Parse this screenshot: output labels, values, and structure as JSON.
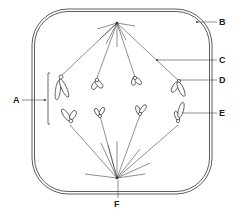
{
  "diagram": {
    "labels": {
      "A": "A",
      "B": "B",
      "C": "C",
      "D": "D",
      "E": "E",
      "F": "F"
    },
    "colors": {
      "line": "#333333",
      "background": "#ffffff"
    }
  }
}
